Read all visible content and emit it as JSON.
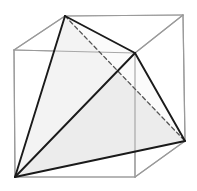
{
  "figure": {
    "title": "Tetrahedron inscribed in a cube",
    "canvas": {
      "width": 197,
      "height": 191,
      "background": "#ffffff"
    },
    "style": {
      "cube_edge_color": "#9a9a9a",
      "cube_edge_width": 1.2,
      "tetra_edge_color": "#1a1a1a",
      "tetra_edge_width": 1.9,
      "tetra_hidden_edge_color": "#555555",
      "tetra_hidden_edge_width": 1.3,
      "tetra_hidden_dash": "4,3",
      "face_fill_light": "#fbfbfb",
      "face_fill_mid": "#f3f3f3",
      "face_fill_dark": "#ececec"
    },
    "cube": {
      "name": "wireframe-cube",
      "vertices": {
        "front_top_left": [
          14,
          50
        ],
        "front_top_right": [
          135,
          53
        ],
        "front_bottom_left": [
          15,
          177
        ],
        "front_bottom_right": [
          135,
          177
        ],
        "back_top_left": [
          65,
          16
        ],
        "back_top_right": [
          183,
          15
        ],
        "back_bottom_left": [
          64,
          142
        ],
        "back_bottom_right": [
          185,
          141
        ]
      },
      "edges": [
        {
          "name": "front-top",
          "from": [
            14,
            50
          ],
          "to": [
            135,
            53
          ]
        },
        {
          "name": "front-left",
          "from": [
            14,
            50
          ],
          "to": [
            15,
            177
          ]
        },
        {
          "name": "front-right",
          "from": [
            135,
            53
          ],
          "to": [
            135,
            177
          ]
        },
        {
          "name": "front-bottom",
          "from": [
            15,
            177
          ],
          "to": [
            135,
            177
          ]
        },
        {
          "name": "back-top",
          "from": [
            65,
            16
          ],
          "to": [
            183,
            15
          ]
        },
        {
          "name": "back-right-vertical",
          "from": [
            183,
            15
          ],
          "to": [
            185,
            141
          ]
        },
        {
          "name": "back-bottom-right",
          "from": [
            135,
            177
          ],
          "to": [
            185,
            141
          ]
        },
        {
          "name": "top-left-diagonal",
          "from": [
            14,
            50
          ],
          "to": [
            65,
            16
          ]
        },
        {
          "name": "top-right-diagonal",
          "from": [
            135,
            53
          ],
          "to": [
            183,
            15
          ]
        }
      ]
    },
    "tetrahedron": {
      "name": "inscribed-tetrahedron",
      "vertices": {
        "apex_top": [
          65,
          16
        ],
        "left_bottom": [
          15,
          177
        ],
        "right_front": [
          135,
          53
        ],
        "right_bottom": [
          185,
          141
        ]
      },
      "visible_edges": [
        {
          "name": "apex-to-left-bottom",
          "from": [
            65,
            16
          ],
          "to": [
            15,
            177
          ]
        },
        {
          "name": "apex-to-right-front",
          "from": [
            65,
            16
          ],
          "to": [
            135,
            53
          ]
        },
        {
          "name": "left-bottom-to-right-front",
          "from": [
            15,
            177
          ],
          "to": [
            135,
            53
          ]
        },
        {
          "name": "left-bottom-to-right-bottom",
          "from": [
            15,
            177
          ],
          "to": [
            185,
            141
          ]
        },
        {
          "name": "right-front-to-right-bottom",
          "from": [
            135,
            53
          ],
          "to": [
            185,
            141
          ]
        }
      ],
      "hidden_edges": [
        {
          "name": "apex-to-right-bottom-hidden",
          "from": [
            65,
            16
          ],
          "to": [
            185,
            141
          ]
        }
      ],
      "faces": [
        {
          "name": "face-front-left",
          "points": "65,16 15,177 135,53",
          "fill": "#f3f3f3"
        },
        {
          "name": "face-front-right",
          "points": "15,177 135,53 185,141",
          "fill": "#ececec"
        },
        {
          "name": "face-top-back",
          "points": "65,16 135,53 185,141",
          "fill": "#fbfbfb"
        }
      ]
    }
  }
}
